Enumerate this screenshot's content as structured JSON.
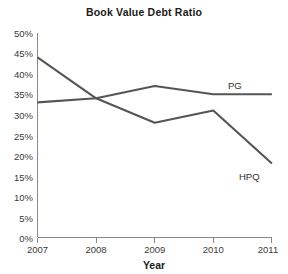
{
  "chart_data": {
    "type": "line",
    "title": "Book Value Debt Ratio",
    "xlabel": "Year",
    "ylabel": "",
    "x": [
      2007,
      2008,
      2009,
      2010,
      2011
    ],
    "categories": [
      "2007",
      "2008",
      "2009",
      "2010",
      "2011"
    ],
    "xlim": [
      2007,
      2011
    ],
    "ylim": [
      0,
      50
    ],
    "ytick_values": [
      0,
      5,
      10,
      15,
      20,
      25,
      30,
      35,
      40,
      45,
      50
    ],
    "ytick_labels": [
      "0%",
      "5%",
      "10%",
      "15%",
      "20%",
      "25%",
      "30%",
      "35%",
      "40%",
      "45%",
      "50%"
    ],
    "xtick_labels": [
      "2007",
      "2008",
      "2009",
      "2010",
      "2011"
    ],
    "grid": false,
    "legend_position": "inline-right",
    "series": [
      {
        "name": "PG",
        "label": "PG",
        "color": "#555555",
        "values": [
          33,
          34,
          37,
          35,
          35
        ]
      },
      {
        "name": "HPQ",
        "label": "HPQ",
        "color": "#555555",
        "values": [
          44,
          34,
          28,
          31,
          18
        ]
      }
    ]
  },
  "axis": {
    "y_labels": [
      "50%",
      "45%",
      "40%",
      "35%",
      "30%",
      "25%",
      "20%",
      "15%",
      "10%",
      "5%",
      "0%"
    ],
    "x_labels": [
      "2007",
      "2008",
      "2009",
      "2010",
      "2011"
    ],
    "x_title": "Year"
  },
  "labels": {
    "pg": "PG",
    "hpq": "HPQ"
  },
  "title": "Book Value Debt Ratio"
}
